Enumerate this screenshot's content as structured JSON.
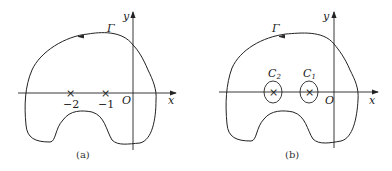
{
  "panel_a": {
    "caption": "(a)",
    "contour_label": "Γ",
    "x_axis_label": "x",
    "y_axis_label": "y",
    "origin_label": "O",
    "points": [
      {
        "label": "−2",
        "x": -2
      },
      {
        "label": "−1",
        "x": -1
      }
    ]
  },
  "panel_b": {
    "caption": "(b)",
    "contour_label": "Γ",
    "x_axis_label": "x",
    "y_axis_label": "y",
    "origin_label": "O",
    "small_circles": [
      {
        "label": "C",
        "sub": "2",
        "around": -2
      },
      {
        "label": "C",
        "sub": "1",
        "around": -1
      }
    ]
  },
  "colors": {
    "stroke": "#222222"
  }
}
